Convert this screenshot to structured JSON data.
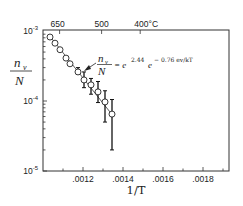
{
  "chart_data": {
    "type": "scatter",
    "title": "",
    "xlabel": "1/T",
    "ylabel": "n_v / N",
    "yscale": "log",
    "xlim": [
      0.001,
      0.00193
    ],
    "ylim": [
      1e-05,
      0.001
    ],
    "x_ticks": [
      ".0012",
      ".0014",
      ".0016",
      ".0018"
    ],
    "x_tick_values": [
      0.0012,
      0.0014,
      0.0016,
      0.0018
    ],
    "y_ticks": [
      {
        "base": "10",
        "exp": "-3",
        "value": 0.001
      },
      {
        "base": "10",
        "exp": "-4",
        "value": 0.0001
      },
      {
        "base": "10",
        "exp": "-5",
        "value": 1e-05
      }
    ],
    "top_axis": {
      "label_unit": "°C",
      "ticks": [
        {
          "label": "650",
          "x": 0.001083
        },
        {
          "label": "500",
          "x": 0.001293
        },
        {
          "label": "400°C",
          "x": 0.001486
        }
      ]
    },
    "grid": false,
    "legend": null,
    "annotation": {
      "lhs_num": "n",
      "lhs_num_sub": "v",
      "lhs_den": "N",
      "rhs": "= e",
      "exp1": "2.44",
      "rhs2": "e",
      "exp2": "− 0.76  ev/kT",
      "arrow_to_x": 0.00118
    },
    "series": [
      {
        "name": "measured vacancy concentration",
        "marker": "open-circle",
        "points": [
          {
            "x": 0.001035,
            "y": 0.00082
          },
          {
            "x": 0.00106,
            "y": 0.00067
          },
          {
            "x": 0.001085,
            "y": 0.00054
          },
          {
            "x": 0.001115,
            "y": 0.00041
          },
          {
            "x": 0.001135,
            "y": 0.00034
          },
          {
            "x": 0.001175,
            "y": 0.00026,
            "err_lo": 0.00024,
            "err_hi": 0.0003
          },
          {
            "x": 0.001205,
            "y": 0.0002,
            "err_lo": 0.000155,
            "err_hi": 0.00026
          },
          {
            "x": 0.00124,
            "y": 0.00017,
            "err_lo": 0.000125,
            "err_hi": 0.00021
          },
          {
            "x": 0.001275,
            "y": 0.000135,
            "err_lo": 9.5e-05,
            "err_hi": 0.00019
          },
          {
            "x": 0.00131,
            "y": 9.7e-05,
            "err_lo": 5e-05,
            "err_hi": 0.00014
          },
          {
            "x": 0.001345,
            "y": 6.5e-05,
            "err_lo": 2e-05,
            "err_hi": 0.000105
          }
        ]
      },
      {
        "name": "fit",
        "style": "line",
        "points": [
          {
            "x": 0.001035,
            "y": 0.00084
          },
          {
            "x": 0.001345,
            "y": 6.4e-05
          }
        ]
      }
    ]
  }
}
